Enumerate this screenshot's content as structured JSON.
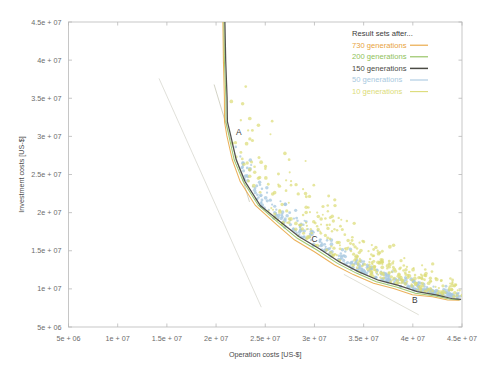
{
  "chart_data": {
    "type": "scatter",
    "title": "",
    "xlabel": "Operation costs [US-$]",
    "ylabel": "Investment costs [US-$]",
    "xlim": [
      5000000,
      45000000
    ],
    "ylim": [
      5000000,
      45000000
    ],
    "grid": false,
    "xticks": [
      "5e + 06",
      "1e + 07",
      "1.5e + 07",
      "2e + 07",
      "2.5e + 07",
      "3e + 07",
      "3.5e + 07",
      "4e + 07",
      "4.5e + 07"
    ],
    "xtick_values": [
      5000000,
      10000000,
      15000000,
      20000000,
      25000000,
      30000000,
      35000000,
      40000000,
      45000000
    ],
    "yticks": [
      "5e + 06",
      "1e + 07",
      "1.5e + 07",
      "2e + 07",
      "2.5e + 07",
      "3e + 07",
      "3.5e + 07",
      "4e + 07",
      "4.5e + 07"
    ],
    "ytick_values": [
      5000000,
      10000000,
      15000000,
      20000000,
      25000000,
      30000000,
      35000000,
      40000000,
      45000000
    ],
    "legend_position": "top-right",
    "legend_title": "Result sets after...",
    "series": [
      {
        "name": "730 generations",
        "color": "#e8a33d",
        "kind": "line",
        "points": [
          [
            20700000,
            45000000
          ],
          [
            20750000,
            40000000
          ],
          [
            20800000,
            35000000
          ],
          [
            20900000,
            32000000
          ],
          [
            21100000,
            30000000
          ],
          [
            21600000,
            27000000
          ],
          [
            22500000,
            24000000
          ],
          [
            24000000,
            21000000
          ],
          [
            26000000,
            18500000
          ],
          [
            28000000,
            16500000
          ],
          [
            30000000,
            14800000
          ],
          [
            32000000,
            13200000
          ],
          [
            34000000,
            11800000
          ],
          [
            36000000,
            10800000
          ],
          [
            38000000,
            10000000
          ],
          [
            40000000,
            9300000
          ],
          [
            42000000,
            8900000
          ],
          [
            43500000,
            8600000
          ],
          [
            44800000,
            8450000
          ]
        ]
      },
      {
        "name": "200 generations",
        "color": "#8fbf5a",
        "kind": "line",
        "points": [
          [
            20800000,
            45000000
          ],
          [
            20850000,
            40000000
          ],
          [
            20950000,
            35000000
          ],
          [
            21050000,
            32000000
          ],
          [
            21300000,
            30000000
          ],
          [
            21800000,
            27000000
          ],
          [
            22800000,
            24000000
          ],
          [
            24300000,
            21000000
          ],
          [
            26300000,
            18600000
          ],
          [
            28300000,
            16700000
          ],
          [
            30300000,
            15000000
          ],
          [
            32300000,
            13400000
          ],
          [
            34300000,
            12000000
          ],
          [
            36300000,
            11000000
          ],
          [
            38300000,
            10200000
          ],
          [
            40300000,
            9500000
          ],
          [
            42300000,
            9000000
          ],
          [
            43800000,
            8700000
          ],
          [
            44900000,
            8500000
          ]
        ]
      },
      {
        "name": "150 generations",
        "color": "#4a4a44",
        "kind": "line",
        "points": [
          [
            20900000,
            45000000
          ],
          [
            20980000,
            40000000
          ],
          [
            21080000,
            35000000
          ],
          [
            21200000,
            32000000
          ],
          [
            21500000,
            30000000
          ],
          [
            22000000,
            27000000
          ],
          [
            23000000,
            24000000
          ],
          [
            24500000,
            21000000
          ],
          [
            26500000,
            18700000
          ],
          [
            28500000,
            16900000
          ],
          [
            30500000,
            15200000
          ],
          [
            32500000,
            13600000
          ],
          [
            34500000,
            12200000
          ],
          [
            36500000,
            11200000
          ],
          [
            38500000,
            10400000
          ],
          [
            40500000,
            9700000
          ],
          [
            42500000,
            9100000
          ],
          [
            43900000,
            8800000
          ],
          [
            44950000,
            8550000
          ]
        ]
      },
      {
        "name": "50 generations",
        "color": "#a9c9e0",
        "kind": "scatter",
        "n_points": 340
      },
      {
        "name": "10 generations",
        "color": "#dcdc78",
        "kind": "scatter",
        "n_points": 360
      }
    ],
    "annotations": [
      {
        "label": "A",
        "x": 22300000,
        "y": 30200000
      },
      {
        "label": "C",
        "x": 30000000,
        "y": 16200000
      },
      {
        "label": "B",
        "x": 40200000,
        "y": 8200000
      }
    ],
    "guide_lines": [
      {
        "name": "tangent-A-upper",
        "color": "#d8d8d0",
        "points": [
          [
            14200000,
            37600000
          ],
          [
            24600000,
            7600000
          ]
        ]
      },
      {
        "name": "tangent-A-lower",
        "color": "#c8c8b8",
        "points": [
          [
            19800000,
            36800000
          ],
          [
            23400000,
            21400000
          ]
        ]
      },
      {
        "name": "tangent-B",
        "color": "#d8d8cc",
        "points": [
          [
            33000000,
            11900000
          ],
          [
            40600000,
            6600000
          ]
        ]
      }
    ]
  }
}
